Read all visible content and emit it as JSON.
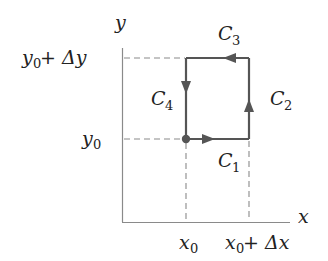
{
  "diagram": {
    "title": "",
    "axes": {
      "x_label": "x",
      "y_label": "y"
    },
    "x_ticks": [
      {
        "base": "x",
        "sub": "0",
        "suffix": ""
      },
      {
        "base": "x",
        "sub": "0",
        "suffix": " + Δx"
      }
    ],
    "y_ticks": [
      {
        "base": "y",
        "sub": "0",
        "suffix": ""
      },
      {
        "base": "y",
        "sub": "0",
        "suffix": " + Δy"
      }
    ],
    "curves": [
      {
        "name": "C",
        "sub": "1",
        "segment": "bottom",
        "direction": "right"
      },
      {
        "name": "C",
        "sub": "2",
        "segment": "right",
        "direction": "up"
      },
      {
        "name": "C",
        "sub": "3",
        "segment": "top",
        "direction": "left"
      },
      {
        "name": "C",
        "sub": "4",
        "segment": "left",
        "direction": "down"
      }
    ],
    "start_point": "(x0, y0)",
    "colors": {
      "axis": "#8a8a8a",
      "path": "#555555",
      "dashed": "#8a8a8a",
      "text": "#222222"
    }
  }
}
